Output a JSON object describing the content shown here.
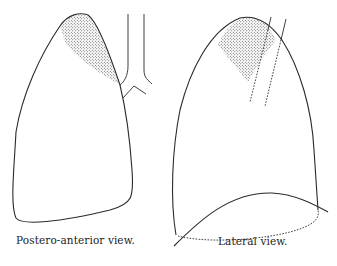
{
  "figure": {
    "panels": [
      {
        "id": "postero-anterior",
        "caption": "Postero-anterior view.",
        "shaded_region": "apex"
      },
      {
        "id": "lateral",
        "caption": "Lateral view.",
        "shaded_region": "apex"
      }
    ],
    "colors": {
      "line": "#2a2a2a",
      "stipple": "#555555",
      "background": "#ffffff"
    }
  }
}
